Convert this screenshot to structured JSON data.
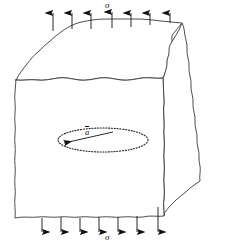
{
  "figure": {
    "type": "engineering-diagram",
    "background_color": "#ffffff",
    "line_color": "#111111",
    "labels": {
      "stress_top": "σ",
      "stress_bottom": "σ",
      "crack_radius": "a",
      "crack_radius_has_overbar": true
    },
    "body": {
      "name": "solid-block",
      "description": "three-dimensional block with hand-drawn wavy fracture-surface edges",
      "faces": [
        "front-face",
        "top-face",
        "right-face"
      ],
      "front_face_outline": "M16,80 C30,77 44,82 58,79 C72,76 86,82 100,79 C114,76 128,82 142,79 C150,77.5 157,79 163,78 L164,122 C163,140 165,160 164,180 C163,196 165,206 164,216 L150,217 C136,215 122,219 108,217 C94,215 80,219 66,217 C52,215 38,219 28,217 L15,218 C16,200 14,182 15,164 C16,146 14,128 15,110 C15.5,100 16,90 16,80 Z",
      "top_face_outline": "M16,80 C24,70 30,62 38,54 C44,47 50,43 56,37 C62,31 68,27 74,24 C82,20 90,18 98,17 C112,16 126,16 140,17 C150,18 158,19 166,20 C172,21 178,21 184,22 C180,28 174,33 170,39 C166,45 172,50 168,56 C166,62 170,68 166,72 C164,75 164,77 163,78 C150,77 136,80 122,78 C108,76 94,81 80,79 C66,77 52,82 38,79 C30,77.5 22,80 16,80 Z",
      "right_face_outline": "M163,78 C168,74 166,68 170,62 C172,56 168,50 172,44 C176,37 180,30 184,22 C188,26 186,34 189,41 C192,48 188,56 191,64 C194,72 190,80 193,88 C196,96 192,104 195,112 C198,120 194,128 197,136 C200,144 196,152 199,160 C201,167 198,174 200,181 C196,184 190,186 186,190 C180,195 176,200 170,205 C167,208 165,212 164,216 C165,206 163,196 164,180 C165,160 163,140 164,122 L163,78 Z"
    },
    "crack": {
      "name": "penny-shaped-crack",
      "shape": "ellipse",
      "style": "dotted",
      "center": [
        103,
        140
      ],
      "rx": 45,
      "ry": 12,
      "radius_arrow": {
        "from": [
          113,
          132
        ],
        "to": [
          62,
          143
        ],
        "label": "a",
        "overbar": true
      }
    },
    "stress_arrows": {
      "top": {
        "name": "tensile-stress-arrows-top",
        "direction": "up",
        "count": 7,
        "x_positions": [
          53,
          72,
          91,
          112,
          131,
          150,
          170
        ],
        "base_y": [
          31,
          29,
          29,
          28,
          27,
          25,
          22
        ],
        "tip_y": 11
      },
      "bottom": {
        "name": "tensile-stress-arrows-bottom",
        "direction": "down",
        "count": 7,
        "x_positions": [
          42,
          61,
          80,
          99,
          118,
          137,
          158
        ],
        "base_y": [
          218,
          217,
          218,
          217,
          217,
          216,
          207
        ],
        "tip_y": 234
      }
    }
  }
}
